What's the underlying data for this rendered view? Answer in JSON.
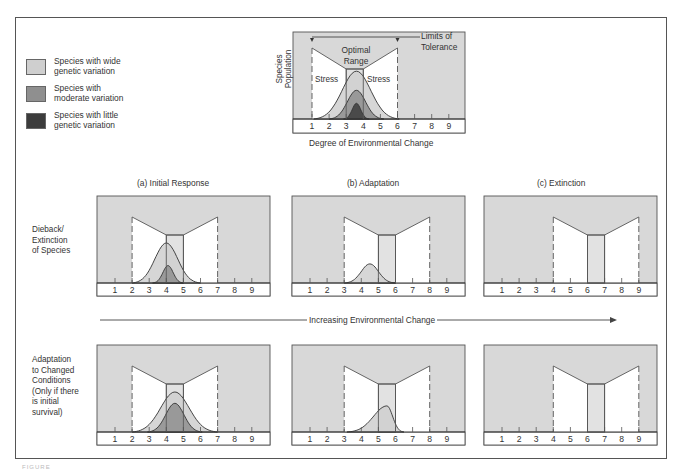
{
  "colors": {
    "panel_bg": "#d8d8d8",
    "tolerance_fill": "#ffffff",
    "optimal_fill": "#e2e2e2",
    "wide": "#cfcfcf",
    "moderate": "#8f8f8f",
    "little": "#3c3c3c",
    "line": "#555555",
    "axis_strip": "#ffffff"
  },
  "legend": [
    {
      "label": "Species with wide\ngenetic variation",
      "color": "#cfcfcf"
    },
    {
      "label": "Species with\nmoderate variation",
      "color": "#8f8f8f"
    },
    {
      "label": "Species with little\ngenetic variation",
      "color": "#3c3c3c"
    }
  ],
  "top_chart": {
    "y_label": "Species\nPopulation",
    "x_label": "Degree of Environmental Change",
    "optimal_label": "Optimal\nRange",
    "stress_left": "Stress",
    "stress_right": "Stress",
    "limits_label": "Limits of\nTolerance",
    "ticks": [
      "1",
      "2",
      "3",
      "4",
      "5",
      "6",
      "7",
      "8",
      "9"
    ],
    "tolerance": [
      1,
      6
    ],
    "optimal": [
      3,
      4
    ],
    "curves": [
      {
        "name": "wide",
        "center": 3.6,
        "halfwidth": 2.5,
        "height": 0.55
      },
      {
        "name": "moderate",
        "center": 3.6,
        "halfwidth": 1.6,
        "height": 0.33
      },
      {
        "name": "little",
        "center": 3.6,
        "halfwidth": 0.75,
        "height": 0.18
      }
    ]
  },
  "columns": [
    {
      "title": "(a)  Initial Response"
    },
    {
      "title": "(b)  Adaptation"
    },
    {
      "title": "(c)  Extinction"
    }
  ],
  "row_labels": [
    "Dieback/\nExtinction\nof Species",
    "Adaptation\nto Changed\nConditions\n(Only if there\nis initial\nsurvival)"
  ],
  "arrow_label": "Increasing Environmental Change",
  "panels": [
    {
      "row": 0,
      "col": 0,
      "ticks": [
        "1",
        "2",
        "3",
        "4",
        "5",
        "6",
        "7",
        "8",
        "9"
      ],
      "tolerance": [
        2,
        7
      ],
      "optimal": [
        4,
        5
      ],
      "curves": [
        {
          "name": "wide",
          "center": 4.0,
          "halfwidth": 2.0,
          "height": 0.46
        },
        {
          "name": "moderate",
          "center": 4.1,
          "halfwidth": 0.9,
          "height": 0.2
        }
      ]
    },
    {
      "row": 0,
      "col": 1,
      "ticks": [
        "1",
        "2",
        "3",
        "4",
        "5",
        "6",
        "7",
        "8",
        "9"
      ],
      "tolerance": [
        3,
        8
      ],
      "optimal": [
        5,
        6
      ],
      "curves": [
        {
          "name": "wide",
          "center": 4.5,
          "halfwidth": 1.5,
          "height": 0.22
        }
      ]
    },
    {
      "row": 0,
      "col": 2,
      "ticks": [
        "1",
        "2",
        "3",
        "4",
        "5",
        "6",
        "7",
        "8",
        "9"
      ],
      "tolerance": [
        4,
        9
      ],
      "optimal": [
        6,
        7
      ],
      "curves": []
    },
    {
      "row": 1,
      "col": 0,
      "ticks": [
        "1",
        "2",
        "3",
        "4",
        "5",
        "6",
        "7",
        "8",
        "9"
      ],
      "tolerance": [
        2,
        7
      ],
      "optimal": [
        4,
        5
      ],
      "curves": [
        {
          "name": "wide",
          "center": 4.5,
          "halfwidth": 2.5,
          "height": 0.46
        },
        {
          "name": "moderate",
          "center": 4.5,
          "halfwidth": 1.6,
          "height": 0.33
        }
      ]
    },
    {
      "row": 1,
      "col": 1,
      "ticks": [
        "1",
        "2",
        "3",
        "4",
        "5",
        "6",
        "7",
        "8",
        "9"
      ],
      "tolerance": [
        3,
        8
      ],
      "optimal": [
        5,
        6
      ],
      "curves": [
        {
          "name": "wide",
          "center": 5.5,
          "halfwidth": 1.8,
          "height": 0.3,
          "skew": true
        }
      ]
    },
    {
      "row": 1,
      "col": 2,
      "ticks": [
        "1",
        "2",
        "3",
        "4",
        "5",
        "6",
        "7",
        "8",
        "9"
      ],
      "tolerance": [
        4,
        9
      ],
      "optimal": [
        6,
        7
      ],
      "curves": []
    }
  ],
  "cropped_caption": "FIGURE"
}
